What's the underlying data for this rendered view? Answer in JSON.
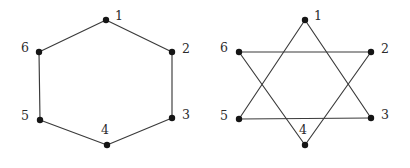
{
  "figure": {
    "background_color": "#ffffff",
    "edge_color": "#3a3a3a",
    "vertex_color": "#151515",
    "label_color": "#2b2b2b",
    "width": 410,
    "height": 168
  },
  "graphs": [
    {
      "id": "hexagon-graph",
      "name": "Hexagon drawing",
      "layout": "hexagon",
      "vertices": [
        {
          "id": "1",
          "label": "1",
          "x": 106,
          "y": 20,
          "label_x": 115,
          "label_y": 10
        },
        {
          "id": "2",
          "label": "2",
          "x": 172,
          "y": 52,
          "label_x": 182,
          "label_y": 43
        },
        {
          "id": "3",
          "label": "3",
          "x": 172,
          "y": 118,
          "label_x": 182,
          "label_y": 109
        },
        {
          "id": "4",
          "label": "4",
          "x": 107,
          "y": 145,
          "label_x": 101,
          "label_y": 124
        },
        {
          "id": "5",
          "label": "5",
          "x": 40,
          "y": 120,
          "label_x": 21,
          "label_y": 110
        },
        {
          "id": "6",
          "label": "6",
          "x": 39,
          "y": 52,
          "label_x": 21,
          "label_y": 42
        }
      ],
      "edges": [
        {
          "from": "1",
          "to": "2"
        },
        {
          "from": "2",
          "to": "3"
        },
        {
          "from": "3",
          "to": "4"
        },
        {
          "from": "4",
          "to": "5"
        },
        {
          "from": "5",
          "to": "6"
        },
        {
          "from": "6",
          "to": "1"
        }
      ]
    },
    {
      "id": "star-graph",
      "name": "Star drawing",
      "layout": "hexagram",
      "vertices": [
        {
          "id": "1",
          "label": "1",
          "x": 305,
          "y": 20,
          "label_x": 314,
          "label_y": 10
        },
        {
          "id": "2",
          "label": "2",
          "x": 371,
          "y": 52,
          "label_x": 381,
          "label_y": 43
        },
        {
          "id": "3",
          "label": "3",
          "x": 371,
          "y": 118,
          "label_x": 381,
          "label_y": 109
        },
        {
          "id": "4",
          "label": "4",
          "x": 305,
          "y": 145,
          "label_x": 299,
          "label_y": 124
        },
        {
          "id": "5",
          "label": "5",
          "x": 239,
          "y": 119,
          "label_x": 220,
          "label_y": 110
        },
        {
          "id": "6",
          "label": "6",
          "x": 239,
          "y": 52,
          "label_x": 220,
          "label_y": 42
        }
      ],
      "edges": [
        {
          "from": "1",
          "to": "3"
        },
        {
          "from": "3",
          "to": "5"
        },
        {
          "from": "5",
          "to": "1"
        },
        {
          "from": "2",
          "to": "4"
        },
        {
          "from": "4",
          "to": "6"
        },
        {
          "from": "6",
          "to": "2"
        }
      ]
    }
  ],
  "style": {
    "vertex_radius": 3.2,
    "edge_width": 1.15,
    "label_font_size": 12.5
  }
}
